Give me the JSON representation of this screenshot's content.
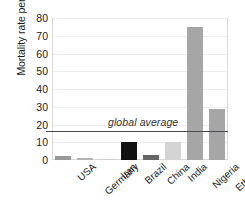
{
  "chart_data": {
    "type": "bar",
    "title": "",
    "xlabel": "",
    "ylabel": "Mortality rate per 100,000",
    "ylim": [
      0,
      80
    ],
    "ytick_values": [
      0,
      10,
      20,
      30,
      40,
      50,
      60,
      70,
      80
    ],
    "ytick_labels": [
      "0",
      "10",
      "20",
      "30",
      "40",
      "50",
      "60",
      "70",
      "80"
    ],
    "grid": true,
    "legend": "none",
    "categories": [
      "USA",
      "Germany",
      "Iran",
      "Brazil",
      "China",
      "India",
      "Nigeria",
      "Ethiopia"
    ],
    "values": [
      2.2,
      0.9,
      0.8,
      10.2,
      3.0,
      10.0,
      75.0,
      29.0
    ],
    "bar_colors": [
      "#999999",
      "#b3b3b3",
      "#cccccc",
      "#111111",
      "#666666",
      "#d4d4d4",
      "#a6a6a6",
      "#a6a6a6"
    ],
    "annotations": [
      {
        "name": "global-average",
        "label": "global average",
        "value": 16.5,
        "type": "horizontal-line",
        "color": "#4a4a52"
      }
    ]
  },
  "axes": {
    "y_title": "Mortality rate per 100,000"
  }
}
